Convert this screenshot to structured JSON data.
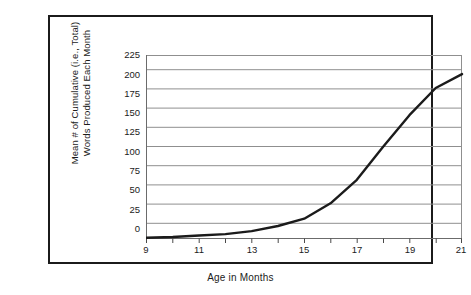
{
  "chart_data": {
    "type": "line",
    "title": "",
    "xlabel": "Age in Months",
    "ylabel": "Mean # of Cumulative (i.e., Total) Words Produced Each Month",
    "ylabel_line1": "Mean # of Cumulative (i.e., Total)",
    "ylabel_line2": "Words Produced Each Month",
    "x": [
      9,
      10,
      11,
      12,
      13,
      14,
      15,
      16,
      17,
      18,
      19,
      20,
      21
    ],
    "values": [
      1,
      2,
      4,
      6,
      10,
      17,
      27,
      48,
      80,
      125,
      168,
      205,
      224
    ],
    "series": [
      {
        "name": "Mean cumulative words",
        "values": [
          1,
          2,
          4,
          6,
          10,
          17,
          27,
          48,
          80,
          125,
          168,
          205,
          224
        ]
      }
    ],
    "xlim": [
      9,
      21
    ],
    "ylim": [
      0,
      250
    ],
    "x_ticks": [
      9,
      10,
      11,
      12,
      13,
      14,
      15,
      16,
      17,
      18,
      19,
      20,
      21
    ],
    "x_tick_labels": [
      "9",
      "",
      "11",
      "",
      "13",
      "",
      "15",
      "",
      "17",
      "",
      "19",
      "",
      "21"
    ],
    "y_ticks": [
      0,
      25,
      50,
      75,
      100,
      125,
      150,
      175,
      200,
      225
    ],
    "y_tick_labels": [
      "225",
      "200",
      "175",
      "150",
      "125",
      "100",
      "75",
      "50",
      "25",
      "0"
    ],
    "grid": "horizontal",
    "legend": "none",
    "line_color": "#1b1b1b",
    "grid_color": "#8f8f8f",
    "axis_color": "#4a4a4a",
    "frame_color": "#1b1b1b",
    "background_color": "#ffffff"
  }
}
